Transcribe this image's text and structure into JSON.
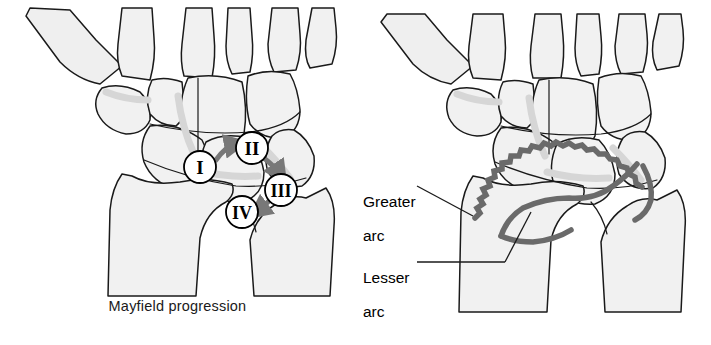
{
  "figure": {
    "background_color": "#ffffff",
    "ink_color": "#1a1a1a",
    "bone_fill": "#f2f2f2",
    "bone_shadow": "#e2e2e2",
    "arc_color": "#6a6a6a",
    "arrow_color": "#787878",
    "marker_fill": "#ffffff",
    "marker_stroke": "#000000"
  },
  "panels": {
    "left": {
      "name": "mayfield-progression-panel",
      "caption": "Mayfield progression",
      "stages": [
        {
          "id": "stage-1",
          "numeral": "I",
          "cx": 200,
          "cy": 167,
          "r": 16
        },
        {
          "id": "stage-2",
          "numeral": "II",
          "cx": 252,
          "cy": 148,
          "r": 16
        },
        {
          "id": "stage-3",
          "numeral": "III",
          "cx": 281,
          "cy": 190,
          "r": 16
        },
        {
          "id": "stage-4",
          "numeral": "IV",
          "cx": 242,
          "cy": 212,
          "r": 16
        }
      ],
      "arrows": [
        {
          "id": "arrow-1-to-2",
          "from": "I",
          "to": "II"
        },
        {
          "id": "arrow-2-to-3",
          "from": "II",
          "to": "III"
        },
        {
          "id": "arrow-3-to-4",
          "from": "III",
          "to": "IV"
        }
      ]
    },
    "right": {
      "name": "carpal-arcs-panel",
      "labels": [
        {
          "id": "greater-arc",
          "text": "Greater\narc",
          "line1": "Greater",
          "line2": "arc"
        },
        {
          "id": "lesser-arc",
          "text": "Lesser\narc",
          "line1": "Lesser",
          "line2": "arc"
        }
      ],
      "arcs": [
        {
          "id": "greater-arc-path",
          "style": "jagged",
          "label": "Greater arc"
        },
        {
          "id": "lesser-arc-path",
          "style": "smooth",
          "label": "Lesser arc"
        }
      ]
    }
  }
}
